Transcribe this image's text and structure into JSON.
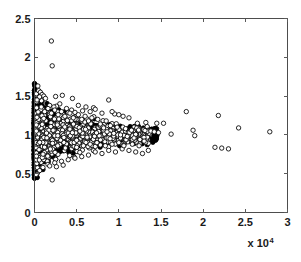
{
  "figure": {
    "background_color": "#ffffff",
    "axis_color": "#4d4d4d",
    "marker_color": "#000000",
    "marker_face_color": "#ffffff"
  },
  "axes": {
    "x_exponent_label": "x 10",
    "x_exponent_power": "4",
    "x_tick_labels": [
      "0",
      "0.5",
      "1",
      "1.5",
      "2",
      "2.5",
      "3"
    ],
    "y_tick_labels": [
      "0",
      "0.5",
      "1",
      "1.5",
      "2",
      "2.5"
    ]
  },
  "chart_data": {
    "type": "scatter",
    "title": "",
    "xlabel": "",
    "ylabel": "",
    "xlim": [
      0,
      3
    ],
    "ylim": [
      0,
      2.5
    ],
    "x_scale_multiplier": 10000,
    "x_tick_values": [
      0,
      0.5,
      1,
      1.5,
      2,
      2.5,
      3
    ],
    "y_tick_values": [
      0,
      0.5,
      1,
      1.5,
      2,
      2.5
    ],
    "grid": false,
    "legend": null,
    "marker": "open-circle",
    "marker_size": 2.2,
    "series": [
      {
        "name": "observations",
        "points": [
          [
            0.2,
            2.21
          ],
          [
            0.21,
            1.89
          ],
          [
            0.04,
            1.63
          ],
          [
            0.05,
            1.57
          ],
          [
            0.07,
            1.55
          ],
          [
            0.09,
            1.52
          ],
          [
            0.11,
            1.5
          ],
          [
            0.06,
            1.49
          ],
          [
            0.13,
            1.47
          ],
          [
            0.03,
            1.45
          ],
          [
            0.33,
            1.51
          ],
          [
            0.45,
            1.47
          ],
          [
            0.88,
            1.45
          ],
          [
            0.3,
            1.4
          ],
          [
            0.52,
            1.38
          ],
          [
            0.61,
            1.36
          ],
          [
            0.7,
            1.35
          ],
          [
            0.72,
            1.33
          ],
          [
            0.26,
            1.37
          ],
          [
            0.38,
            1.34
          ],
          [
            0.44,
            1.32
          ],
          [
            0.57,
            1.31
          ],
          [
            0.66,
            1.3
          ],
          [
            0.18,
            1.38
          ],
          [
            0.23,
            1.36
          ],
          [
            0.48,
            1.29
          ],
          [
            0.8,
            1.28
          ],
          [
            0.95,
            1.27
          ],
          [
            1.05,
            1.24
          ],
          [
            1.12,
            1.22
          ],
          [
            0.92,
            1.3
          ],
          [
            1.0,
            1.26
          ],
          [
            1.8,
            1.3
          ],
          [
            2.18,
            1.25
          ],
          [
            2.42,
            1.09
          ],
          [
            2.79,
            1.04
          ],
          [
            1.22,
            1.15
          ],
          [
            1.32,
            1.16
          ],
          [
            1.45,
            1.15
          ],
          [
            1.53,
            1.15
          ],
          [
            1.38,
            1.05
          ],
          [
            1.42,
            1.04
          ],
          [
            1.47,
            1.03
          ],
          [
            1.62,
            1.01
          ],
          [
            1.88,
            1.06
          ],
          [
            1.9,
            0.99
          ],
          [
            2.14,
            0.84
          ],
          [
            2.22,
            0.83
          ],
          [
            2.3,
            0.82
          ],
          [
            0.85,
            1.18
          ],
          [
            0.9,
            1.12
          ],
          [
            0.98,
            1.1
          ],
          [
            1.08,
            1.08
          ],
          [
            1.15,
            1.06
          ],
          [
            0.75,
            1.2
          ],
          [
            0.78,
            1.14
          ],
          [
            0.82,
            1.09
          ],
          [
            0.86,
            1.04
          ],
          [
            0.94,
            1.02
          ],
          [
            1.02,
            1.0
          ],
          [
            1.1,
            0.98
          ],
          [
            1.18,
            0.96
          ],
          [
            1.25,
            0.94
          ],
          [
            1.3,
            0.92
          ],
          [
            0.68,
            1.22
          ],
          [
            0.64,
            1.18
          ],
          [
            0.6,
            1.24
          ],
          [
            0.56,
            1.2
          ],
          [
            0.52,
            1.26
          ],
          [
            0.46,
            1.22
          ],
          [
            0.42,
            1.28
          ],
          [
            0.36,
            1.24
          ],
          [
            0.32,
            1.3
          ],
          [
            0.28,
            1.26
          ],
          [
            0.24,
            1.32
          ],
          [
            0.2,
            1.28
          ],
          [
            0.16,
            1.34
          ],
          [
            0.12,
            1.3
          ],
          [
            0.08,
            1.36
          ],
          [
            0.72,
            0.78
          ],
          [
            0.8,
            0.76
          ],
          [
            0.88,
            0.8
          ],
          [
            0.96,
            0.78
          ],
          [
            1.04,
            0.82
          ],
          [
            1.12,
            0.8
          ],
          [
            1.2,
            0.78
          ],
          [
            1.28,
            0.76
          ],
          [
            1.35,
            0.8
          ],
          [
            0.64,
            0.74
          ],
          [
            0.56,
            0.72
          ],
          [
            0.48,
            0.7
          ],
          [
            0.4,
            0.68
          ],
          [
            0.32,
            0.66
          ],
          [
            0.24,
            0.64
          ],
          [
            0.16,
            0.62
          ],
          [
            0.1,
            0.58
          ],
          [
            0.06,
            0.54
          ],
          [
            0.03,
            0.5
          ],
          [
            0.02,
            0.49
          ],
          [
            0.18,
            0.6
          ],
          [
            0.26,
            0.59
          ],
          [
            0.34,
            0.61
          ],
          [
            0.21,
            0.42
          ],
          [
            0.5,
            0.84
          ],
          [
            0.58,
            0.86
          ],
          [
            0.66,
            0.88
          ],
          [
            0.74,
            0.9
          ],
          [
            0.84,
            0.86
          ],
          [
            0.92,
            0.88
          ],
          [
            1.0,
            0.9
          ],
          [
            1.06,
            0.86
          ],
          [
            1.16,
            0.88
          ],
          [
            1.24,
            0.86
          ]
        ]
      }
    ]
  }
}
